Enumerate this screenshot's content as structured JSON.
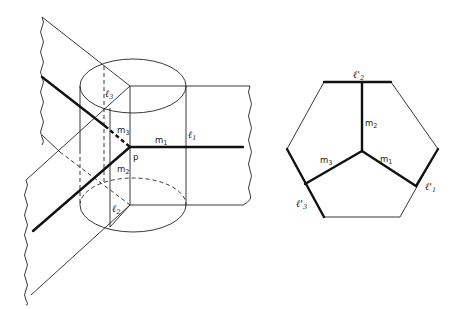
{
  "figure": {
    "left_panel": {
      "description": "Perspective view of three half-planes meeting along lines through point p, intersected with a cylinder",
      "point_label": "p",
      "labels": {
        "l1": "ℓ1",
        "l2": "ℓ2",
        "l3": "ℓ3",
        "m1": "m1",
        "m2": "m2",
        "m3": "m3"
      }
    },
    "right_panel": {
      "description": "Hexagon cross-section with three bold segments meeting at center",
      "labels": {
        "l1p": "ℓ'1",
        "l2p": "ℓ'2",
        "l3p": "ℓ'3",
        "m1": "m1",
        "m2": "m2",
        "m3": "m3"
      }
    }
  }
}
